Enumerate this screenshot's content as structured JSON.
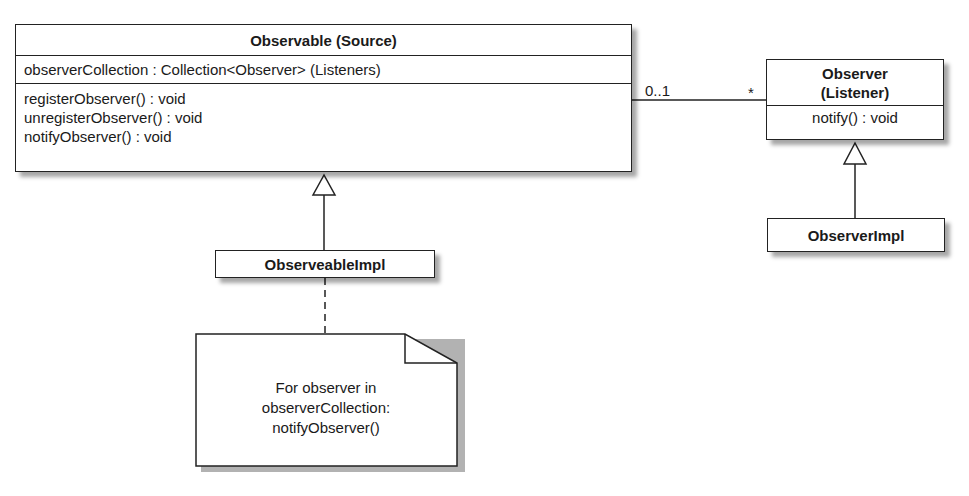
{
  "observable": {
    "name": "Observable (Source)",
    "attributes": [
      "observerCollection : Collection<Observer> (Listeners)"
    ],
    "operations": [
      "registerObserver() : void",
      "unregisterObserver() : void",
      "notifyObserver() : void"
    ]
  },
  "observer": {
    "name_line1": "Observer",
    "name_line2": "(Listener)",
    "operations": [
      "notify() : void"
    ]
  },
  "observable_impl": {
    "name": "ObserveableImpl"
  },
  "observer_impl": {
    "name": "ObserverImpl"
  },
  "association": {
    "source_multiplicity": "0..1",
    "target_multiplicity": "*"
  },
  "note": {
    "lines": [
      "For observer in",
      "observerCollection:",
      "notifyObserver()"
    ]
  }
}
